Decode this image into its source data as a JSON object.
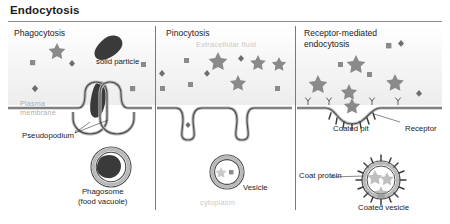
{
  "figure": {
    "title": "Endocytosis",
    "type": "biology-process-diagram",
    "panel_count": 3
  },
  "panels": [
    {
      "id": "phagocytosis",
      "heading": "Phagocytosis",
      "labels": {
        "solid_particle": "solid particle",
        "plasma_membrane": "Plasma\nmembrane",
        "pseudopodium": "Pseudopodium",
        "phagosome": "Phagosome\n(food vacuole)"
      }
    },
    {
      "id": "pinocytosis",
      "heading": "Pinocytosis",
      "labels": {
        "extracellular_fluid": "Extracellular fluid",
        "vesicle": "Vesicle",
        "cytoplasm": "cytoplasm"
      }
    },
    {
      "id": "receptor-mediated-endocytosis",
      "heading": "Receptor-mediated\nendocytosis",
      "labels": {
        "coated_pit": "Coated pit",
        "receptor": "Receptor",
        "coat_protein": "Coat protein",
        "coated_vesicle": "Coated vesicle"
      }
    }
  ],
  "colors": {
    "membrane_stroke": "#4a4a4a",
    "membrane_fill": "#b9b9b9",
    "particle_gray": "#8a8a8a",
    "particle_dark": "#3a3a3a",
    "text": "#1b1b1b",
    "faint_text": "#c9c9c9",
    "rule": "#8c8c8c",
    "background": "#ffffff"
  }
}
